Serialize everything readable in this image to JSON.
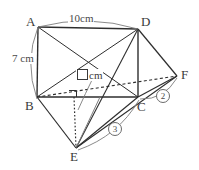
{
  "figure": {
    "type": "geometry-diagram",
    "vertices": [
      {
        "id": "A",
        "label": "A",
        "x": 38,
        "y": 27,
        "label_x": 26,
        "label_y": 15
      },
      {
        "id": "D",
        "label": "D",
        "x": 138,
        "y": 29,
        "label_x": 141,
        "label_y": 15
      },
      {
        "id": "B",
        "label": "B",
        "x": 37,
        "y": 97,
        "label_x": 25,
        "label_y": 99
      },
      {
        "id": "C",
        "label": "C",
        "x": 138,
        "y": 97,
        "label_x": 137,
        "label_y": 100
      },
      {
        "id": "F",
        "label": "F",
        "x": 177,
        "y": 76,
        "label_x": 181,
        "label_y": 68
      },
      {
        "id": "E",
        "label": "E",
        "x": 76,
        "y": 148,
        "label_x": 70,
        "label_y": 150
      }
    ],
    "dimensions": [
      {
        "id": "ad",
        "text": "10cm",
        "x": 68,
        "y": 13
      },
      {
        "id": "ab",
        "text": "7 cm",
        "x": 11,
        "y": 53
      }
    ],
    "unknown": {
      "id": "be-height",
      "text": "cm",
      "x": 76,
      "y": 69
    },
    "ratios": [
      {
        "id": "cf",
        "text": "2",
        "x": 156,
        "y": 89
      },
      {
        "id": "ce",
        "text": "3",
        "x": 108,
        "y": 122
      }
    ],
    "right_angle": {
      "id": "right-angle-at-foot",
      "x": 69,
      "y": 97,
      "size": 7
    },
    "colors": {
      "stroke": "#2e2e2e",
      "light_stroke": "#7d7d7d",
      "background": "#ffffff"
    }
  }
}
